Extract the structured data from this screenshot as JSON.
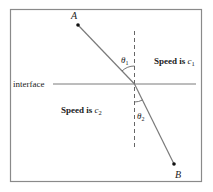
{
  "diagram": {
    "title_fragment": "",
    "points": {
      "A": {
        "label": "A"
      },
      "B": {
        "label": "B"
      }
    },
    "interface_label": "interface",
    "region1": {
      "text": "Speed is ",
      "var": "c",
      "sub": "1"
    },
    "region2": {
      "text": "Speed is ",
      "var": "c",
      "sub": "2"
    },
    "angle1": {
      "symbol": "θ",
      "sub": "1"
    },
    "angle2": {
      "symbol": "θ",
      "sub": "2"
    },
    "colors": {
      "frame": "#8a8a8a",
      "line": "#7a7a7a",
      "text": "#222222",
      "point": "#111111"
    }
  }
}
